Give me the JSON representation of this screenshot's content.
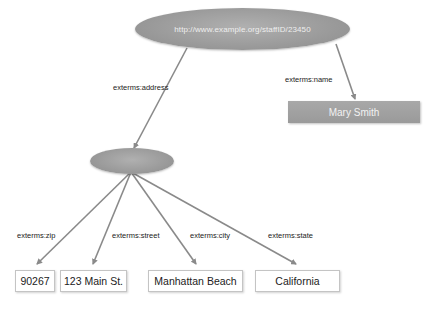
{
  "diagram": {
    "root_node": {
      "label": "http://www.example.org/staffID/23450",
      "shape": "ellipse"
    },
    "blank_node": {
      "label": "",
      "shape": "ellipse"
    },
    "name_node": {
      "label": "Mary Smith",
      "shape": "rectangle"
    },
    "edges": {
      "address": "exterms:address",
      "name": "exterms:name",
      "zip": "exterms:zip",
      "street": "exterms:street",
      "city": "exterms:city",
      "state": "exterms:state"
    },
    "literals": {
      "zip": "90267",
      "street": "123 Main St.",
      "city": "Manhattan Beach",
      "state": "California"
    },
    "colors": {
      "node_fill": "#9a9a9a",
      "node_text": "#eeeeee",
      "edge": "#8a8a8a",
      "literal_border": "#c4c4c4"
    }
  }
}
